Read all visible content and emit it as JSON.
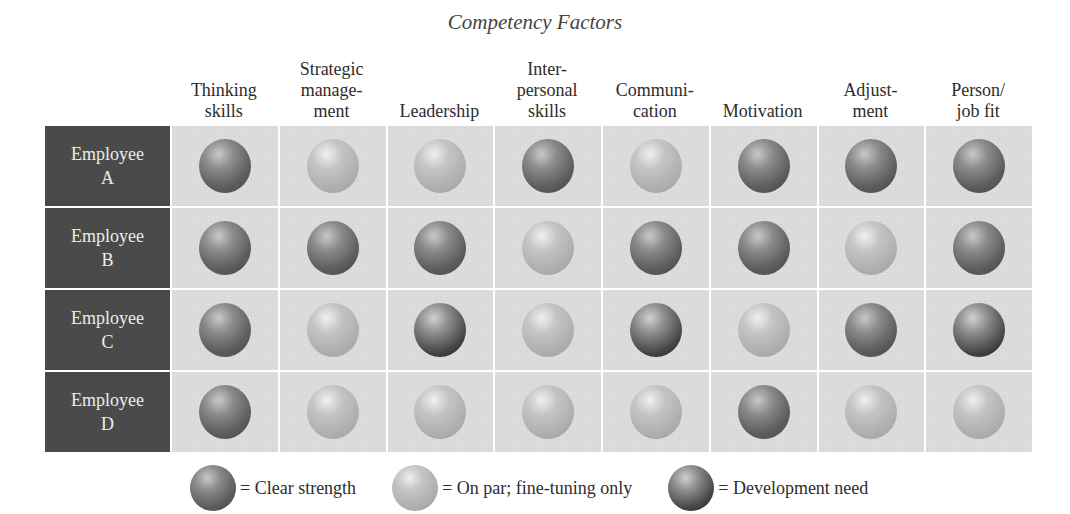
{
  "chart_data": {
    "type": "table",
    "title": "Competency Factors",
    "columns": [
      "Thinking skills",
      "Strategic management",
      "Leadership",
      "Interpersonal skills",
      "Communication",
      "Motivation",
      "Adjustment",
      "Person/job fit"
    ],
    "rows": [
      "Employee A",
      "Employee B",
      "Employee C",
      "Employee D"
    ],
    "values": [
      [
        "strength",
        "par",
        "par",
        "strength",
        "par",
        "strength",
        "strength",
        "strength"
      ],
      [
        "strength",
        "strength",
        "strength",
        "par",
        "strength",
        "strength",
        "par",
        "strength"
      ],
      [
        "strength",
        "par",
        "development",
        "par",
        "development",
        "par",
        "strength",
        "development"
      ],
      [
        "strength",
        "par",
        "par",
        "par",
        "par",
        "strength",
        "par",
        "par"
      ]
    ],
    "legend": [
      {
        "key": "strength",
        "label": "= Clear strength"
      },
      {
        "key": "par",
        "label": "= On par; fine-tuning only"
      },
      {
        "key": "development",
        "label": "= Development need"
      }
    ]
  },
  "title": "Competency Factors",
  "column_headers": [
    "Thinking\nskills",
    "Strategic\nmanage-\nment",
    "Leadership",
    "Inter-\npersonal\nskills",
    "Communi-\ncation",
    "Motivation",
    "Adjust-\nment",
    "Person/\njob fit"
  ],
  "rows": [
    {
      "line1": "Employee",
      "line2": "A"
    },
    {
      "line1": "Employee",
      "line2": "B"
    },
    {
      "line1": "Employee",
      "line2": "C"
    },
    {
      "line1": "Employee",
      "line2": "D"
    }
  ],
  "legend": [
    {
      "key": "strength",
      "label": "= Clear strength"
    },
    {
      "key": "par",
      "label": "= On par; fine-tuning only"
    },
    {
      "key": "development",
      "label": "= Development need"
    }
  ]
}
